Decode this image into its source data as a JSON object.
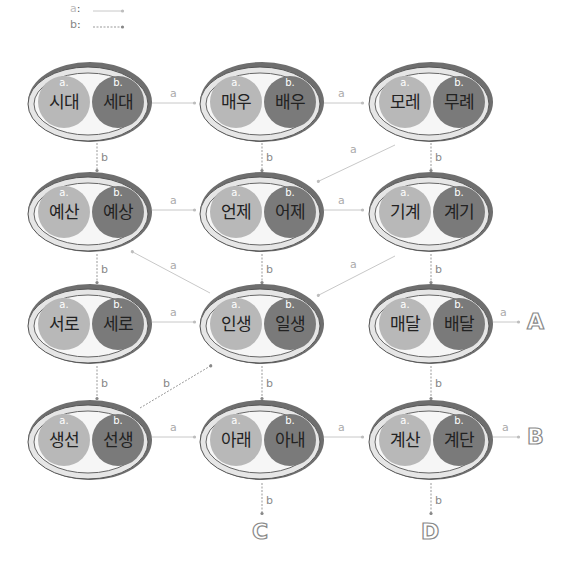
{
  "legend": {
    "a": {
      "label": "a",
      "line": "solid"
    },
    "b": {
      "label": "b",
      "line": "dotted"
    }
  },
  "colors": {
    "pill_a": "#b8b8b8",
    "pill_b": "#7a7a7a",
    "edge_a": "#c8c8c8",
    "edge_b": "#999999",
    "rim": "#6e6e6e"
  },
  "nodes": [
    {
      "id": "r0c0",
      "a_tag": "a.",
      "a": "시대",
      "b_tag": "b.",
      "b": "세대"
    },
    {
      "id": "r0c1",
      "a_tag": "a.",
      "a": "매우",
      "b_tag": "b.",
      "b": "배우"
    },
    {
      "id": "r0c2",
      "a_tag": "a.",
      "a": "모레",
      "b_tag": "b.",
      "b": "무례"
    },
    {
      "id": "r1c0",
      "a_tag": "a.",
      "a": "예산",
      "b_tag": "b.",
      "b": "예상"
    },
    {
      "id": "r1c1",
      "a_tag": "a.",
      "a": "언제",
      "b_tag": "b.",
      "b": "어제"
    },
    {
      "id": "r1c2",
      "a_tag": "a.",
      "a": "기계",
      "b_tag": "b.",
      "b": "계기"
    },
    {
      "id": "r2c0",
      "a_tag": "a.",
      "a": "서로",
      "b_tag": "b.",
      "b": "세로"
    },
    {
      "id": "r2c1",
      "a_tag": "a.",
      "a": "인생",
      "b_tag": "b.",
      "b": "일생"
    },
    {
      "id": "r2c2",
      "a_tag": "a.",
      "a": "매달",
      "b_tag": "b.",
      "b": "배달"
    },
    {
      "id": "r3c0",
      "a_tag": "a.",
      "a": "생선",
      "b_tag": "b.",
      "b": "선생"
    },
    {
      "id": "r3c1",
      "a_tag": "a.",
      "a": "아래",
      "b_tag": "b.",
      "b": "아내"
    },
    {
      "id": "r3c2",
      "a_tag": "a.",
      "a": "계산",
      "b_tag": "b.",
      "b": "계단"
    }
  ],
  "edges": [
    {
      "from": "r0c0",
      "to": "r0c1",
      "label": "a"
    },
    {
      "from": "r0c0",
      "to": "r1c0",
      "label": "b"
    },
    {
      "from": "r0c1",
      "to": "r0c2",
      "label": "a"
    },
    {
      "from": "r0c1",
      "to": "r1c1",
      "label": "b"
    },
    {
      "from": "r0c2",
      "to": "r1c1",
      "label": "a"
    },
    {
      "from": "r0c2",
      "to": "r1c2",
      "label": "b"
    },
    {
      "from": "r1c0",
      "to": "r1c1",
      "label": "a"
    },
    {
      "from": "r1c0",
      "to": "r2c0",
      "label": "b"
    },
    {
      "from": "r1c1",
      "to": "r1c2",
      "label": "a"
    },
    {
      "from": "r1c1",
      "to": "r2c1",
      "label": "b"
    },
    {
      "from": "r2c1",
      "to": "r1c0",
      "label": "a"
    },
    {
      "from": "r1c2",
      "to": "r2c1",
      "label": "a"
    },
    {
      "from": "r1c2",
      "to": "r2c2",
      "label": "b"
    },
    {
      "from": "r2c0",
      "to": "r2c1",
      "label": "a"
    },
    {
      "from": "r2c0",
      "to": "r3c0",
      "label": "b"
    },
    {
      "from": "r2c1",
      "to": "r3c1",
      "label": "b"
    },
    {
      "from": "r2c2",
      "to": "A",
      "label": "a"
    },
    {
      "from": "r2c2",
      "to": "r3c2",
      "label": "b"
    },
    {
      "from": "r3c0",
      "to": "r3c1",
      "label": "a"
    },
    {
      "from": "r3c0",
      "to": "r2c1",
      "label": "b"
    },
    {
      "from": "r3c1",
      "to": "r3c2",
      "label": "a"
    },
    {
      "from": "r3c1",
      "to": "C",
      "label": "b"
    },
    {
      "from": "r3c2",
      "to": "B",
      "label": "a"
    },
    {
      "from": "r3c2",
      "to": "D",
      "label": "b"
    }
  ],
  "terminals": {
    "A": "A",
    "B": "B",
    "C": "C",
    "D": "D"
  }
}
